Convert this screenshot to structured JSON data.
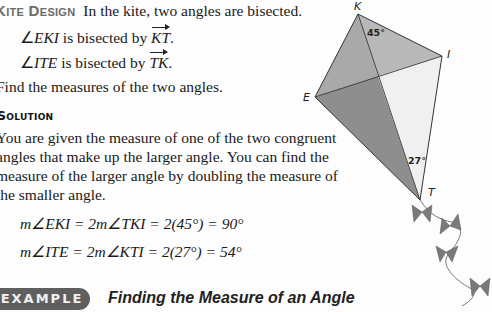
{
  "problem": {
    "heading": "Kite Design",
    "intro": "In the kite, two angles are bisected.",
    "bisections": [
      {
        "angle": "EKI",
        "text": " is bisected by ",
        "ray": "KT"
      },
      {
        "angle": "ITE",
        "text": " is bisected by ",
        "ray": "TK"
      }
    ],
    "task": "Find the measures of the two angles."
  },
  "solution": {
    "heading": "Solution",
    "lines": [
      "You are given the measure of one of the two congruent",
      "angles that make up the larger angle. You can find the",
      "measure of the larger angle by doubling the measure of",
      "the smaller angle."
    ],
    "equations": [
      "m∠EKI = 2m∠TKI = 2(45°) = 90°",
      "m∠ITE = 2m∠KTI = 2(27°) = 54°"
    ]
  },
  "figure": {
    "labels": {
      "K": "K",
      "I": "I",
      "E": "E",
      "T": "T"
    },
    "angles": {
      "top": "45°",
      "bottom": "27°"
    },
    "colors": {
      "dark": "#8c8c8c",
      "mid": "#b3b3b3",
      "light": "#efefef",
      "stroke": "#333333",
      "bow": "#7a7a7a"
    }
  },
  "example": {
    "badge": "EXAMPLE 5",
    "title": "Finding the Measure of an Angle"
  }
}
